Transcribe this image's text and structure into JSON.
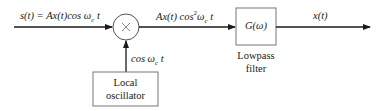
{
  "diagram": {
    "colors": {
      "stroke": "#3a3a3a",
      "arrow": "#1a1a1a",
      "background": "#ffffff"
    },
    "signals": {
      "input": "s(t) = Ax(t)cos ω",
      "input_sub": "c",
      "input_tail": " t",
      "mixer_out": "Ax(t) cos",
      "mixer_out_sup": "2",
      "mixer_out_tail": "ω",
      "mixer_out_sub": "c",
      "mixer_out_t": " t",
      "oscillator_out": "cos ω",
      "oscillator_out_sub": "c",
      "oscillator_out_tail": " t",
      "output": "x(t)"
    },
    "blocks": {
      "multiplier": {
        "symbol": "×"
      },
      "filter": {
        "label": "G(ω)",
        "caption_line1": "Lowpass",
        "caption_line2": "filter"
      },
      "oscillator": {
        "line1": "Local",
        "line2": "oscillator"
      }
    }
  }
}
